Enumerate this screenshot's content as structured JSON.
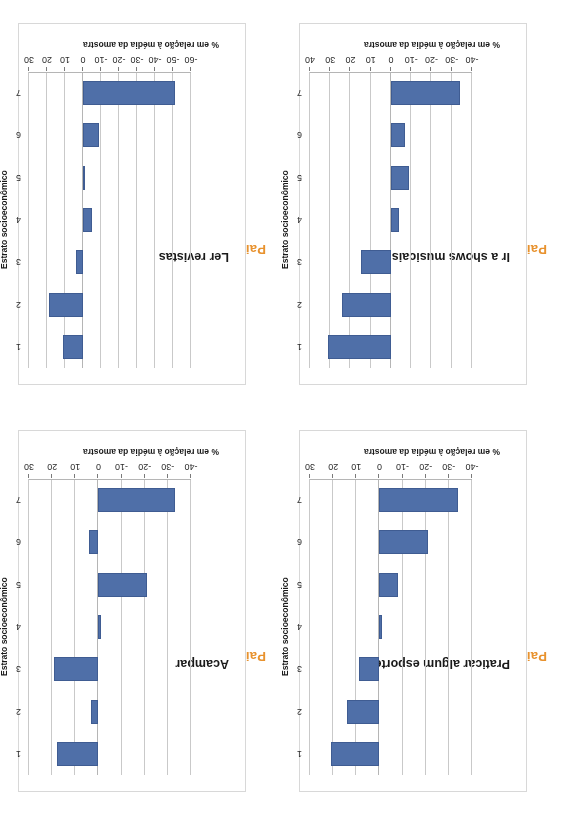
{
  "page": {
    "background": "#ffffff",
    "bar_color": "#4F6FA8",
    "panel_tag_color": "#E8922E",
    "orientation_note": "scanned page rotated 180 degrees"
  },
  "panels": [
    {
      "tag": "Painel E",
      "title": "Praticar algum esporte",
      "xlabel": "Estrato socioeconômico",
      "ylabel": "% em relação à média da amostra",
      "categories": [
        "1",
        "2",
        "3",
        "4",
        "5",
        "6",
        "7"
      ],
      "yticks": [
        "30",
        "20",
        "10",
        "0",
        "-10",
        "-20",
        "-30",
        "-40"
      ],
      "values": [
        21,
        14,
        9,
        -1,
        -8,
        -21,
        -34
      ]
    },
    {
      "tag": "Painel F",
      "title": "Ir a shows musicais",
      "xlabel": "Estrato socioeconômico",
      "ylabel": "% em relação à média da amostra",
      "categories": [
        "1",
        "2",
        "3",
        "4",
        "5",
        "6",
        "7"
      ],
      "yticks": [
        "40",
        "30",
        "20",
        "10",
        "0",
        "-10",
        "-20",
        "-30",
        "-40"
      ],
      "values": [
        31,
        24,
        15,
        -4,
        -9,
        -7,
        -34
      ]
    },
    {
      "tag": "Painel G",
      "title": "Acampar",
      "xlabel": "Estrato socioeconômico",
      "ylabel": "% em relação à média da amostra",
      "categories": [
        "1",
        "2",
        "3",
        "4",
        "5",
        "6",
        "7"
      ],
      "yticks": [
        "30",
        "20",
        "10",
        "0",
        "-10",
        "-20",
        "-30",
        "-40"
      ],
      "values": [
        18,
        3,
        19,
        -1,
        -21,
        4,
        -33
      ]
    },
    {
      "tag": "Painel H",
      "title": "Ler revistas",
      "xlabel": "Estrato socioeconômico",
      "ylabel": "% em relação à média da amostra",
      "categories": [
        "1",
        "2",
        "3",
        "4",
        "5",
        "6",
        "7"
      ],
      "yticks": [
        "30",
        "20",
        "10",
        "0",
        "-10",
        "-20",
        "-30",
        "-40",
        "-50",
        "-60"
      ],
      "values": [
        11,
        19,
        4,
        -5,
        -1,
        -9,
        -51
      ]
    }
  ],
  "chart_data": [
    {
      "type": "bar",
      "title": "Praticar algum esporte",
      "panel": "Painel E",
      "xlabel": "Estrato socioeconômico",
      "ylabel": "% em relação à média da amostra",
      "categories": [
        "1",
        "2",
        "3",
        "4",
        "5",
        "6",
        "7"
      ],
      "values": [
        21,
        14,
        9,
        -1,
        -8,
        -21,
        -34
      ],
      "ylim": [
        -40,
        30
      ],
      "ytick_values": [
        30,
        20,
        10,
        0,
        -10,
        -20,
        -30,
        -40
      ],
      "grid": true,
      "legend": "none"
    },
    {
      "type": "bar",
      "title": "Ir a shows musicais",
      "panel": "Painel F",
      "xlabel": "Estrato socioeconômico",
      "ylabel": "% em relação à média da amostra",
      "categories": [
        "1",
        "2",
        "3",
        "4",
        "5",
        "6",
        "7"
      ],
      "values": [
        31,
        24,
        15,
        -4,
        -9,
        -7,
        -34
      ],
      "ylim": [
        -40,
        40
      ],
      "ytick_values": [
        40,
        30,
        20,
        10,
        0,
        -10,
        -20,
        -30,
        -40
      ],
      "grid": true,
      "legend": "none"
    },
    {
      "type": "bar",
      "title": "Acampar",
      "panel": "Painel G",
      "xlabel": "Estrato socioeconômico",
      "ylabel": "% em relação à média da amostra",
      "categories": [
        "1",
        "2",
        "3",
        "4",
        "5",
        "6",
        "7"
      ],
      "values": [
        18,
        3,
        19,
        -1,
        -21,
        4,
        -33
      ],
      "ylim": [
        -40,
        30
      ],
      "ytick_values": [
        30,
        20,
        10,
        0,
        -10,
        -20,
        -30,
        -40
      ],
      "grid": true,
      "legend": "none"
    },
    {
      "type": "bar",
      "title": "Ler revistas",
      "panel": "Painel H",
      "xlabel": "Estrato socioeconômico",
      "ylabel": "% em relação à média da amostra",
      "categories": [
        "1",
        "2",
        "3",
        "4",
        "5",
        "6",
        "7"
      ],
      "values": [
        11,
        19,
        4,
        -5,
        -1,
        -9,
        -51
      ],
      "ylim": [
        -60,
        30
      ],
      "ytick_values": [
        30,
        20,
        10,
        0,
        -10,
        -20,
        -30,
        -40,
        -50,
        -60
      ],
      "grid": true,
      "legend": "none"
    }
  ]
}
